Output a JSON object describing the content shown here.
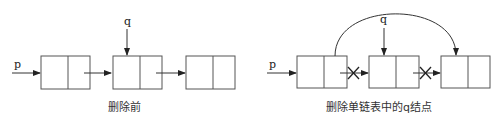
{
  "diagram": {
    "left": {
      "caption": "删除前",
      "pointer_p": "p",
      "pointer_q": "q",
      "nodes": 3
    },
    "right": {
      "caption": "删除单链表中的q结点",
      "pointer_p": "p",
      "pointer_q": "q",
      "nodes": 3,
      "removed_links": 2
    },
    "colors": {
      "stroke": "#333333",
      "background": "#ffffff"
    }
  }
}
